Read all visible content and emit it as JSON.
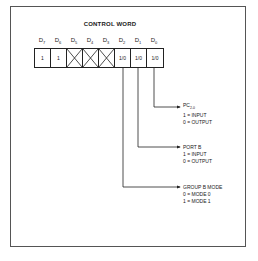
{
  "title": "CONTROL WORD",
  "bits": [
    {
      "label": "D",
      "sub": "7",
      "value": "1",
      "crossed": false
    },
    {
      "label": "D",
      "sub": "6",
      "value": "1",
      "crossed": false
    },
    {
      "label": "D",
      "sub": "5",
      "value": "",
      "crossed": true
    },
    {
      "label": "D",
      "sub": "4",
      "value": "",
      "crossed": true
    },
    {
      "label": "D",
      "sub": "3",
      "value": "",
      "crossed": true
    },
    {
      "label": "D",
      "sub": "2",
      "value": "1/0",
      "crossed": false
    },
    {
      "label": "D",
      "sub": "1",
      "value": "1/0",
      "crossed": false
    },
    {
      "label": "D",
      "sub": "0",
      "value": "1/0",
      "crossed": false
    }
  ],
  "descriptions": {
    "d0": {
      "head": "PC",
      "head_sub": "2-0",
      "line1": "1 = INPUT",
      "line2": "0 = OUTPUT"
    },
    "d1": {
      "head": "PORT B",
      "line1": "1 = INPUT",
      "line2": "0 = OUTPUT"
    },
    "d2": {
      "head": "GROUP B MODE",
      "line1": "0 = MODE 0",
      "line2": "1 = MODE 1"
    }
  },
  "colors": {
    "line": "#222222",
    "frame": "#555555",
    "background": "#ffffff"
  }
}
